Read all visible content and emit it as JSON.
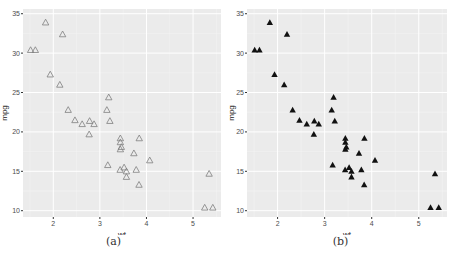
{
  "chart_data": [
    {
      "type": "scatter",
      "panel_label": "(a)",
      "marker": "open-triangle",
      "marker_color": "#7f7f7f",
      "xlabel": "wt",
      "ylabel": "mpg",
      "xticks": [
        2,
        3,
        4,
        5
      ],
      "yticks": [
        10,
        15,
        20,
        25,
        30,
        35
      ],
      "xlim": [
        1.35,
        5.6
      ],
      "ylim": [
        9.2,
        35.6
      ],
      "grid": true,
      "background": "#ebebeb",
      "points": [
        [
          2.62,
          21.0
        ],
        [
          2.875,
          21.0
        ],
        [
          2.32,
          22.8
        ],
        [
          3.215,
          21.4
        ],
        [
          3.44,
          18.7
        ],
        [
          3.46,
          18.1
        ],
        [
          3.57,
          14.3
        ],
        [
          3.19,
          24.4
        ],
        [
          3.15,
          22.8
        ],
        [
          3.44,
          19.2
        ],
        [
          3.44,
          17.8
        ],
        [
          4.07,
          16.4
        ],
        [
          3.73,
          17.3
        ],
        [
          3.78,
          15.2
        ],
        [
          5.25,
          10.4
        ],
        [
          5.424,
          10.4
        ],
        [
          5.345,
          14.7
        ],
        [
          2.2,
          32.4
        ],
        [
          1.615,
          30.4
        ],
        [
          1.835,
          33.9
        ],
        [
          2.465,
          21.5
        ],
        [
          3.52,
          15.5
        ],
        [
          3.435,
          15.2
        ],
        [
          3.84,
          13.3
        ],
        [
          3.845,
          19.2
        ],
        [
          1.935,
          27.3
        ],
        [
          2.14,
          26.0
        ],
        [
          1.513,
          30.4
        ],
        [
          3.17,
          15.8
        ],
        [
          2.77,
          19.7
        ],
        [
          3.57,
          15.0
        ],
        [
          2.78,
          21.4
        ]
      ]
    },
    {
      "type": "scatter",
      "panel_label": "(b)",
      "marker": "filled-triangle",
      "marker_color": "#111111",
      "xlabel": "wt",
      "ylabel": "mpg",
      "xticks": [
        2,
        3,
        4,
        5
      ],
      "yticks": [
        10,
        15,
        20,
        25,
        30,
        35
      ],
      "xlim": [
        1.35,
        5.6
      ],
      "ylim": [
        9.2,
        35.6
      ],
      "grid": true,
      "background": "#ebebeb",
      "points": [
        [
          2.62,
          21.0
        ],
        [
          2.875,
          21.0
        ],
        [
          2.32,
          22.8
        ],
        [
          3.215,
          21.4
        ],
        [
          3.44,
          18.7
        ],
        [
          3.46,
          18.1
        ],
        [
          3.57,
          14.3
        ],
        [
          3.19,
          24.4
        ],
        [
          3.15,
          22.8
        ],
        [
          3.44,
          19.2
        ],
        [
          3.44,
          17.8
        ],
        [
          4.07,
          16.4
        ],
        [
          3.73,
          17.3
        ],
        [
          3.78,
          15.2
        ],
        [
          5.25,
          10.4
        ],
        [
          5.424,
          10.4
        ],
        [
          5.345,
          14.7
        ],
        [
          2.2,
          32.4
        ],
        [
          1.615,
          30.4
        ],
        [
          1.835,
          33.9
        ],
        [
          2.465,
          21.5
        ],
        [
          3.52,
          15.5
        ],
        [
          3.435,
          15.2
        ],
        [
          3.84,
          13.3
        ],
        [
          3.845,
          19.2
        ],
        [
          1.935,
          27.3
        ],
        [
          2.14,
          26.0
        ],
        [
          1.513,
          30.4
        ],
        [
          3.17,
          15.8
        ],
        [
          2.77,
          19.7
        ],
        [
          3.57,
          15.0
        ],
        [
          2.78,
          21.4
        ]
      ]
    }
  ],
  "captions": {
    "a": "(a)",
    "b": "(b)"
  }
}
